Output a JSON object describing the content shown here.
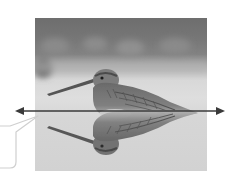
{
  "figure": {
    "photo_colors": {
      "background_top": "#6e6e6e",
      "water": "#d6d6d6",
      "bird_body": "#7a7a7a",
      "bird_dark": "#4a4a4a"
    },
    "arrow": {
      "type": "double-headed-horizontal",
      "meaning": "line-of-symmetry",
      "color": "#3a3a3a",
      "y": 111,
      "x_start": 15,
      "x_end": 225
    },
    "callout": {
      "shape": "speech-bubble",
      "text": "",
      "fill": "#ffffff",
      "stroke": "#d0d0d0"
    }
  }
}
